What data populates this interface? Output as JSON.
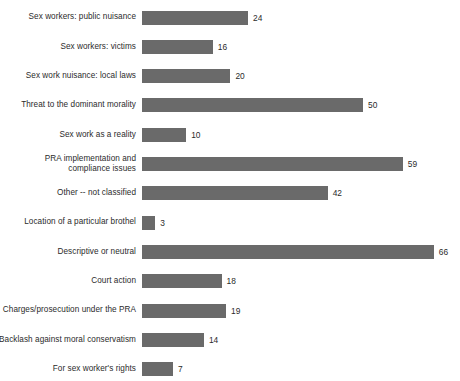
{
  "chart_data": {
    "type": "bar",
    "orientation": "horizontal",
    "title": "",
    "subtitle": "",
    "xlabel": "",
    "ylabel": "",
    "xlim": [
      0,
      70
    ],
    "grid": false,
    "legend": null,
    "bar_color": "#6a6a6a",
    "categories": [
      "Sex workers: public nuisance",
      "Sex workers: victims",
      "Sex work nuisance: local laws",
      "Threat to the dominant morality",
      "Sex work as a reality",
      "PRA implementation and\ncompliance issues",
      "Other -- not classified",
      "Location of a particular brothel",
      "Descriptive or neutral",
      "Court action",
      "Charges/prosecution under the PRA",
      "Backlash against moral conservatism",
      "For sex worker's rights"
    ],
    "values": [
      24,
      16,
      20,
      50,
      10,
      59,
      42,
      3,
      66,
      18,
      19,
      14,
      7
    ],
    "value_labels": [
      "24",
      "16",
      "20",
      "50",
      "10",
      "59",
      "42",
      "3",
      "66",
      "18",
      "19",
      "14",
      "7"
    ]
  }
}
